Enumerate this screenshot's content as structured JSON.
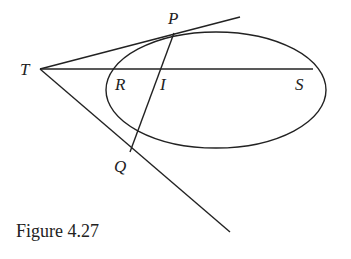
{
  "caption": "Figure 4.27",
  "labels": {
    "T": "T",
    "P": "P",
    "R": "R",
    "I": "I",
    "S": "S",
    "Q": "Q"
  },
  "colors": {
    "stroke": "#222222",
    "background": "#ffffff"
  }
}
